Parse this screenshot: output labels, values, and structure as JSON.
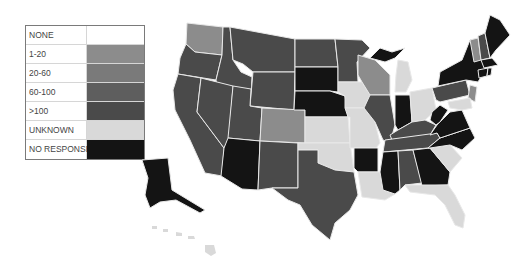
{
  "legend": {
    "items": [
      {
        "label": "NONE",
        "color": "#ffffff",
        "key": "none"
      },
      {
        "label": "1-20",
        "color": "#8c8c8c",
        "key": "c1_20"
      },
      {
        "label": "20-60",
        "color": "#7a7a7a",
        "key": "c20_60"
      },
      {
        "label": "60-100",
        "color": "#5e5e5e",
        "key": "c60_100"
      },
      {
        "label": ">100",
        "color": "#4a4a4a",
        "key": "gt100"
      },
      {
        "label": "UNKNOWN",
        "color": "#d9d9d9",
        "key": "unknown"
      },
      {
        "label": "NO RESPONSE",
        "color": "#141414",
        "key": "noresp"
      }
    ]
  },
  "map": {
    "region": "United States",
    "states": {
      "WA": "c1_20",
      "OR": "gt100",
      "CA": "gt100",
      "ID": "gt100",
      "NV": "gt100",
      "MT": "gt100",
      "WY": "gt100",
      "UT": "gt100",
      "AZ": "noresp",
      "CO": "c1_20",
      "NM": "gt100",
      "ND": "gt100",
      "SD": "noresp",
      "NE": "noresp",
      "KS": "unknown",
      "OK": "unknown",
      "TX": "gt100",
      "MN": "gt100",
      "IA": "unknown",
      "MO": "unknown",
      "AR": "noresp",
      "LA": "unknown",
      "WI": "c1_20",
      "IL": "gt100",
      "MI_UP": "noresp",
      "MI": "unknown",
      "IN": "noresp",
      "OH": "unknown",
      "KY": "gt100",
      "TN": "gt100",
      "MS": "noresp",
      "AL": "gt100",
      "GA": "noresp",
      "FL": "unknown",
      "SC": "unknown",
      "NC": "noresp",
      "VA": "noresp",
      "WV": "noresp",
      "PA": "gt100",
      "NY": "noresp",
      "NJ": "c1_20",
      "MD": "unknown",
      "VT": "c1_20",
      "NH": "gt100",
      "ME": "noresp",
      "MA": "noresp",
      "CT": "noresp",
      "RI": "noresp",
      "AK": "noresp",
      "HI": "unknown"
    }
  }
}
